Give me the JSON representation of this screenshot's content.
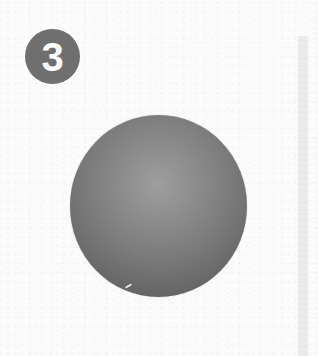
{
  "figure": {
    "step_badge": {
      "number": "3",
      "color": "#6f6f6f",
      "text_color": "#ffffff"
    },
    "sphere": {
      "description": "shaded sphere",
      "highlight_color": "#9e9e9e",
      "shadow_color": "#4f4f4f"
    },
    "side_bar": {
      "color": "#e8e8e8"
    },
    "background_color": "#fbfbfb"
  }
}
